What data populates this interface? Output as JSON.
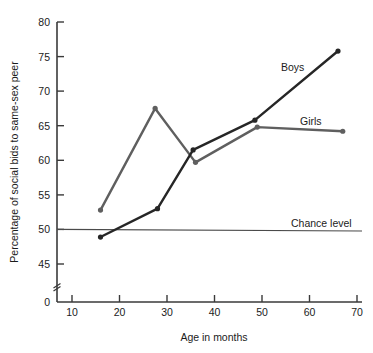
{
  "chart_data": {
    "type": "line",
    "title": "",
    "xlabel": "Age in months",
    "ylabel": "Percentage of social bids to same-sex peer",
    "xlim": [
      0,
      70
    ],
    "ylim": [
      43,
      80
    ],
    "y_axis_break": true,
    "y_break_from": 0,
    "y_break_to": 43,
    "grid": false,
    "legend": "inline-labels",
    "xticks": [
      10,
      20,
      30,
      40,
      50,
      60,
      70
    ],
    "xtick_labels": [
      "10",
      "20",
      "30",
      "40",
      "50",
      "60",
      "70"
    ],
    "yticks": [
      45,
      50,
      55,
      60,
      65,
      70,
      75,
      80
    ],
    "ytick_labels": [
      "45",
      "50",
      "55",
      "60",
      "65",
      "70",
      "75",
      "80"
    ],
    "y_origin_label": "0",
    "series": [
      {
        "name": "Boys",
        "color": "#262626",
        "x": [
          16,
          28,
          35.5,
          48.5,
          66
        ],
        "values": [
          48.9,
          53.0,
          61.5,
          65.8,
          75.8
        ],
        "label": "Boys"
      },
      {
        "name": "Girls",
        "color": "#5f5f5f",
        "x": [
          16,
          27.5,
          36,
          49,
          67
        ],
        "values": [
          52.8,
          67.5,
          59.7,
          64.8,
          64.2
        ],
        "label": "Girls"
      }
    ],
    "annotations": [
      {
        "name": "chance-level",
        "label": "Chance level",
        "type": "hline",
        "value": 50,
        "color": "#4a4a4a"
      }
    ]
  }
}
